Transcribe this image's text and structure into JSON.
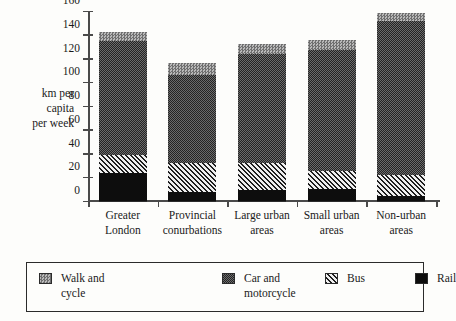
{
  "chart_data": {
    "type": "bar",
    "subtype": "stacked-bar",
    "title": "",
    "xlabel": "",
    "ylabel": "km per capita per week",
    "ylabel_lines": [
      "km per",
      "capita",
      "per week"
    ],
    "ylim": [
      0,
      160
    ],
    "ytick_values": [
      0,
      20,
      40,
      60,
      80,
      100,
      120,
      140,
      160
    ],
    "ytick_labels": [
      "0",
      "20",
      "40",
      "60",
      "80",
      "100",
      "120",
      "140",
      "160"
    ],
    "grid": false,
    "legend_position": "bottom",
    "categories": [
      "Greater London",
      "Provincial conurbations",
      "Large urban areas",
      "Small urban areas",
      "Non-urban areas"
    ],
    "category_lines": [
      [
        "Greater",
        "London"
      ],
      [
        "Provincial",
        "conurbations"
      ],
      [
        "Large urban",
        "areas"
      ],
      [
        "Small urban",
        "areas"
      ],
      [
        "Non-urban",
        "areas"
      ]
    ],
    "stack_order_bottom_to_top": [
      "Rail",
      "Bus",
      "Car and motorcycle",
      "Walk and cycle"
    ],
    "series": [
      {
        "name": "Rail",
        "key": "rail",
        "pattern": "solid-black",
        "values": [
          24,
          8,
          9,
          10,
          4
        ]
      },
      {
        "name": "Bus",
        "key": "bus",
        "pattern": "diagonal-hatch",
        "values": [
          15,
          24,
          23,
          15,
          18
        ]
      },
      {
        "name": "Car and motorcycle",
        "key": "car",
        "pattern": "dense-dots",
        "values": [
          96,
          74,
          92,
          102,
          130
        ]
      },
      {
        "name": "Walk and cycle",
        "key": "walk",
        "pattern": "checker-gray",
        "values": [
          7,
          10,
          8,
          9,
          6
        ]
      }
    ],
    "totals": [
      142,
      116,
      132,
      136,
      158
    ],
    "segment_tops": {
      "rail": [
        24,
        8,
        9,
        10,
        4
      ],
      "bus": [
        39,
        32,
        32,
        25,
        22
      ],
      "car": [
        135,
        106,
        124,
        127,
        152
      ],
      "walk": [
        142,
        116,
        132,
        136,
        158
      ]
    }
  },
  "legend": {
    "items": [
      {
        "key": "walk",
        "lines": [
          "Walk and",
          "cycle"
        ]
      },
      {
        "key": "car",
        "lines": [
          "Car and",
          "motorcycle"
        ]
      },
      {
        "key": "bus",
        "lines": [
          "Bus"
        ]
      },
      {
        "key": "rail",
        "lines": [
          "Rail"
        ]
      }
    ]
  },
  "colors": {
    "background": "#fdfdfb",
    "axis": "#4a4a4a",
    "text": "#1a1a1a",
    "rail": "#0d0d0d",
    "bus": "#d8d8d8",
    "car": "#3a3a3a",
    "walk": "#8c8c8c",
    "border": "#2b2b2b"
  }
}
